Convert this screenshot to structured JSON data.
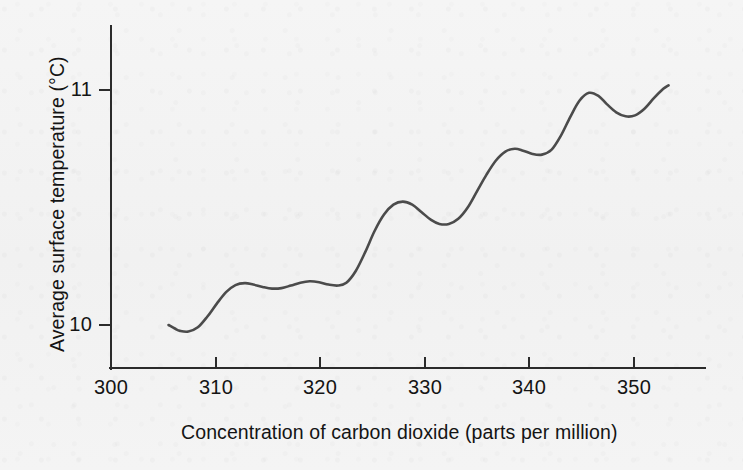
{
  "figure": {
    "background_color": "#f3f3f3",
    "curve_color": "#4b4b4b",
    "axis_color": "#2b2b2b"
  },
  "axes": {
    "x_title": "Concentration of carbon dioxide (parts per million)",
    "y_title": "Average surface temperature (°C)",
    "x_ticks": [
      "300",
      "310",
      "320",
      "330",
      "340",
      "350"
    ],
    "y_ticks": [
      "11",
      "10"
    ]
  },
  "chart_data": {
    "type": "line",
    "title": "",
    "xlabel": "Concentration of carbon dioxide (parts per million)",
    "ylabel": "Average surface temperature (°C)",
    "xlim": [
      300,
      356.8
    ],
    "ylim": [
      9.817,
      11.455
    ],
    "xticks": [
      300,
      310,
      320,
      330,
      340,
      350
    ],
    "yticks": [
      10,
      11
    ],
    "grid": false,
    "legend": null,
    "series": [
      {
        "name": "Average surface temperature vs CO2 concentration",
        "x": [
          305.5,
          306.1,
          306.6,
          307.4,
          308.3,
          309.2,
          310.1,
          311.0,
          311.9,
          312.8,
          313.6,
          314.5,
          315.4,
          316.3,
          317.2,
          318.1,
          319.0,
          319.9,
          320.8,
          321.7,
          322.5,
          323.4,
          324.3,
          325.2,
          326.1,
          327.0,
          327.9,
          328.8,
          329.7,
          330.6,
          331.4,
          332.3,
          333.2,
          334.1,
          335.0,
          335.9,
          336.8,
          337.7,
          338.6,
          339.4,
          340.3,
          341.2,
          342.1,
          343.0,
          343.9,
          344.8,
          345.7,
          346.6,
          347.4,
          348.3,
          349.2,
          350.1,
          351.0,
          351.9,
          352.8,
          353.3
        ],
        "y": [
          10.0,
          9.985,
          9.975,
          9.972,
          9.99,
          10.035,
          10.09,
          10.14,
          10.17,
          10.178,
          10.172,
          10.162,
          10.155,
          10.157,
          10.168,
          10.18,
          10.186,
          10.182,
          10.172,
          10.168,
          10.18,
          10.23,
          10.31,
          10.4,
          10.47,
          10.512,
          10.525,
          10.512,
          10.48,
          10.447,
          10.43,
          10.43,
          10.452,
          10.5,
          10.57,
          10.64,
          10.7,
          10.738,
          10.75,
          10.742,
          10.728,
          10.725,
          10.745,
          10.805,
          10.885,
          10.955,
          10.988,
          10.975,
          10.94,
          10.905,
          10.888,
          10.892,
          10.92,
          10.965,
          11.005,
          11.02
        ]
      }
    ]
  }
}
